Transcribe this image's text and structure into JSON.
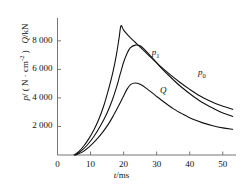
{
  "chart_data": {
    "type": "line",
    "title": "",
    "xlabel": "t/ms",
    "ylabel": "p/(N · cm-2)   Q/kN",
    "xlim": [
      0,
      54
    ],
    "ylim": [
      0,
      9600
    ],
    "xticks": [
      0,
      10,
      20,
      30,
      40,
      50
    ],
    "xticklabels": [
      "0",
      "10",
      "20",
      "30",
      "40",
      "50"
    ],
    "yticks": [
      2000,
      4000,
      6000,
      8000
    ],
    "yticklabels": [
      "2 000",
      "4 000",
      "6 000",
      "8 000"
    ],
    "grid": false,
    "legend_position": "inline-annotations",
    "series": [
      {
        "name": "p0",
        "label": "p0",
        "color": "#111111",
        "points": [
          [
            5.0,
            0
          ],
          [
            6.5,
            250
          ],
          [
            8.0,
            650
          ],
          [
            9.5,
            1150
          ],
          [
            11.0,
            1750
          ],
          [
            12.5,
            2500
          ],
          [
            14.0,
            3450
          ],
          [
            15.5,
            4650
          ],
          [
            16.8,
            5850
          ],
          [
            17.8,
            7000
          ],
          [
            18.6,
            8150
          ],
          [
            19.2,
            9050
          ],
          [
            20.0,
            8750
          ],
          [
            21.5,
            8350
          ],
          [
            23.5,
            7900
          ],
          [
            25.5,
            7450
          ],
          [
            28.0,
            6900
          ],
          [
            31.0,
            6250
          ],
          [
            34.0,
            5650
          ],
          [
            37.0,
            5100
          ],
          [
            40.0,
            4600
          ],
          [
            43.0,
            4150
          ],
          [
            46.0,
            3800
          ],
          [
            49.0,
            3500
          ],
          [
            53.0,
            3200
          ]
        ]
      },
      {
        "name": "p1",
        "label": "p1",
        "color": "#111111",
        "points": [
          [
            5.2,
            0
          ],
          [
            7.0,
            250
          ],
          [
            9.0,
            700
          ],
          [
            11.0,
            1300
          ],
          [
            13.0,
            2050
          ],
          [
            15.0,
            2950
          ],
          [
            16.5,
            3800
          ],
          [
            17.8,
            4700
          ],
          [
            19.0,
            5700
          ],
          [
            20.0,
            6500
          ],
          [
            21.0,
            7100
          ],
          [
            22.0,
            7500
          ],
          [
            23.5,
            7700
          ],
          [
            25.0,
            7650
          ],
          [
            26.5,
            7350
          ],
          [
            28.5,
            6850
          ],
          [
            31.0,
            6200
          ],
          [
            34.0,
            5500
          ],
          [
            37.0,
            4850
          ],
          [
            40.0,
            4300
          ],
          [
            43.0,
            3800
          ],
          [
            46.0,
            3400
          ],
          [
            49.0,
            3050
          ],
          [
            53.0,
            2700
          ]
        ]
      },
      {
        "name": "Q",
        "label": "Q",
        "color": "#111111",
        "points": [
          [
            5.5,
            0
          ],
          [
            7.5,
            200
          ],
          [
            9.5,
            550
          ],
          [
            11.5,
            1000
          ],
          [
            13.5,
            1550
          ],
          [
            15.5,
            2200
          ],
          [
            17.0,
            2800
          ],
          [
            18.5,
            3450
          ],
          [
            19.8,
            4050
          ],
          [
            21.0,
            4600
          ],
          [
            22.2,
            4950
          ],
          [
            23.5,
            5050
          ],
          [
            25.0,
            4950
          ],
          [
            27.0,
            4650
          ],
          [
            29.5,
            4200
          ],
          [
            32.0,
            3750
          ],
          [
            35.0,
            3250
          ],
          [
            38.0,
            2850
          ],
          [
            41.0,
            2500
          ],
          [
            44.0,
            2250
          ],
          [
            47.0,
            2050
          ],
          [
            50.0,
            1900
          ],
          [
            53.0,
            1800
          ]
        ]
      }
    ],
    "annotations": [
      {
        "text": "p1",
        "base": "p",
        "sub": "1",
        "x": 28.5,
        "y": 7150
      },
      {
        "text": "p0",
        "base": "p",
        "sub": "0",
        "x": 42.5,
        "y": 5750
      },
      {
        "text": "Q",
        "base": "Q",
        "sub": "",
        "x": 31.0,
        "y": 4500
      }
    ]
  },
  "axis_labels": {
    "x_axis": {
      "var": "t",
      "unit": "/ms"
    },
    "y_axis": {
      "part1_var": "p",
      "part1_unit": "/ ( N · cm",
      "part1_exp": "-2",
      "part1_close": " )",
      "part2_var": "Q",
      "part2_unit": "/kN"
    }
  }
}
